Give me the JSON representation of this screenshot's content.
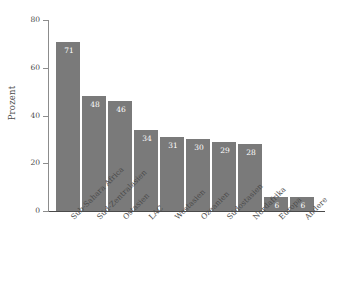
{
  "chart_data": {
    "type": "bar",
    "title": "",
    "subtitle": "",
    "xlabel": "",
    "ylabel": "Prozent",
    "ylim": [
      0,
      80
    ],
    "yticks": [
      0,
      20,
      40,
      60,
      80
    ],
    "ytick_labels": [
      "0",
      "20",
      "40",
      "60",
      "80"
    ],
    "grid": false,
    "legend": false,
    "bar_color": "#7a7a7a",
    "value_label_color": "#ffffff",
    "background_color": "#ffffff",
    "axis_color": "#4a4a4a",
    "categories": [
      "Sub-Sahara Africa",
      "Süd-Zentralasien",
      "Ostasien",
      "LAC",
      "Westasien",
      "Ozeanien",
      "Südostasien",
      "Nordafrika",
      "Europa",
      "Andere"
    ],
    "values": [
      71,
      48,
      46,
      34,
      31,
      30,
      29,
      28,
      6,
      6
    ],
    "value_labels": [
      "71",
      "48",
      "46",
      "34",
      "31",
      "30",
      "29",
      "28",
      "6",
      "6"
    ]
  }
}
